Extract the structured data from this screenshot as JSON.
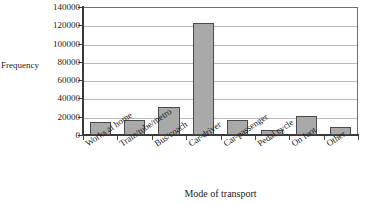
{
  "chart_data": {
    "type": "bar",
    "title": "Bar chart to show mode of travel to work",
    "xlabel": "Mode of transport",
    "ylabel": "Frequency",
    "categories": [
      "Works at home",
      "Train/tube/metro",
      "Bus/coach",
      "Car-driver",
      "Car-passenger",
      "Pedal cycle",
      "On foot",
      "Other"
    ],
    "values": [
      14000,
      16000,
      31000,
      122500,
      16000,
      5000,
      21000,
      9000
    ],
    "ylim": [
      0,
      140000
    ],
    "ytick_values": [
      0,
      20000,
      40000,
      60000,
      80000,
      100000,
      120000,
      140000
    ],
    "ytick_labels": [
      "0",
      "20000",
      "40000",
      "60000",
      "80000",
      "100000",
      "120000",
      "140000"
    ],
    "grid": true,
    "legend": false,
    "bar_fill_color": "#a9a9a9",
    "bar_border_color": "#4a4a4a",
    "gridline_color": "#b9b9b9",
    "axis_color": "#3a3a3a"
  }
}
